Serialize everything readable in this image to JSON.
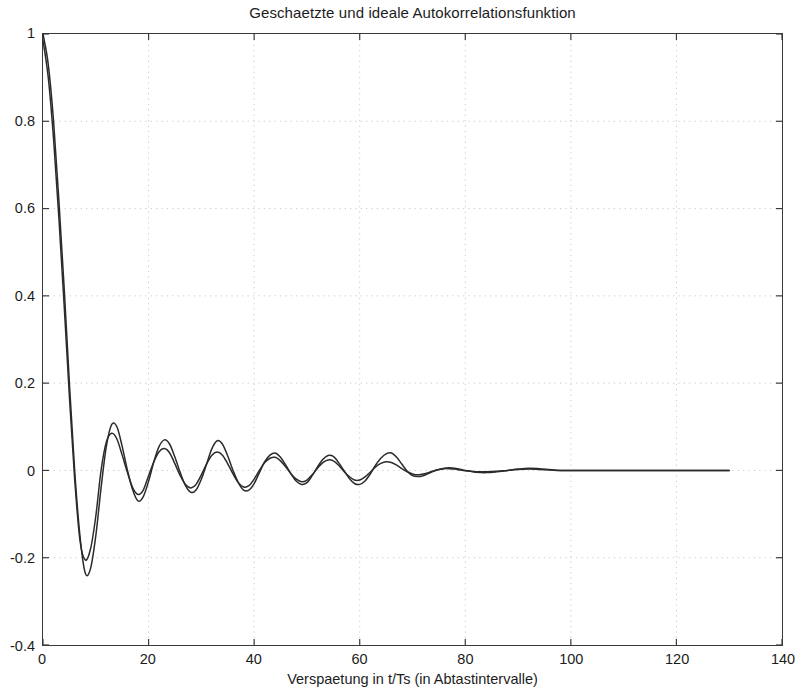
{
  "chart_data": {
    "type": "line",
    "title": "Geschaetzte und ideale Autokorrelationsfunktion",
    "xlabel": "Verspaetung in t/Ts (in Abtastintervalle)",
    "ylabel": "",
    "xlim": [
      0,
      140
    ],
    "ylim": [
      -0.4,
      1.0
    ],
    "xticks": [
      0,
      20,
      40,
      60,
      80,
      100,
      120,
      140
    ],
    "xtick_labels": [
      "0",
      "20",
      "40",
      "60",
      "80",
      "100",
      "120",
      "140"
    ],
    "yticks": [
      -0.4,
      -0.2,
      0,
      0.2,
      0.4,
      0.6,
      0.8,
      1
    ],
    "ytick_labels": [
      "-0.4",
      "-0.2",
      "0",
      "0.2",
      "0.4",
      "0.6",
      "0.8",
      "1"
    ],
    "grid": true,
    "grid_style": "dotted",
    "grid_color": "#c9c9c9",
    "legend": null,
    "line_color": "#2b2b2b",
    "series": [
      {
        "name": "geschaetzte Autokorrelationsfunktion",
        "x": [
          0,
          1,
          2,
          3,
          4,
          5,
          6,
          7,
          8,
          9,
          10,
          11,
          12,
          13,
          14,
          15,
          16,
          17,
          18,
          19,
          20,
          21,
          22,
          23,
          24,
          25,
          26,
          27,
          28,
          29,
          30,
          31,
          32,
          33,
          34,
          35,
          36,
          37,
          38,
          39,
          40,
          41,
          42,
          43,
          44,
          45,
          46,
          47,
          48,
          49,
          50,
          51,
          52,
          53,
          54,
          55,
          56,
          57,
          58,
          59,
          60,
          61,
          62,
          63,
          64,
          65,
          66,
          67,
          68,
          69,
          70,
          71,
          72,
          73,
          74,
          75,
          76,
          77,
          78,
          79,
          80,
          82,
          84,
          86,
          88,
          90,
          92,
          94,
          96,
          98,
          100,
          104,
          108,
          112,
          116,
          120,
          124,
          128,
          130
        ],
        "y": [
          1.0,
          0.93,
          0.8,
          0.62,
          0.42,
          0.2,
          0.0,
          -0.15,
          -0.235,
          -0.225,
          -0.15,
          -0.04,
          0.055,
          0.105,
          0.1,
          0.055,
          0.0,
          -0.045,
          -0.07,
          -0.06,
          -0.025,
          0.02,
          0.055,
          0.07,
          0.06,
          0.03,
          -0.005,
          -0.035,
          -0.05,
          -0.045,
          -0.02,
          0.015,
          0.05,
          0.068,
          0.06,
          0.033,
          0.0,
          -0.028,
          -0.045,
          -0.045,
          -0.03,
          -0.005,
          0.02,
          0.035,
          0.04,
          0.03,
          0.012,
          -0.008,
          -0.025,
          -0.032,
          -0.028,
          -0.012,
          0.008,
          0.025,
          0.034,
          0.032,
          0.018,
          0.0,
          -0.018,
          -0.03,
          -0.032,
          -0.024,
          -0.008,
          0.012,
          0.028,
          0.038,
          0.04,
          0.03,
          0.014,
          -0.002,
          -0.012,
          -0.014,
          -0.012,
          -0.007,
          -0.002,
          0.002,
          0.005,
          0.006,
          0.005,
          0.003,
          0.0,
          -0.004,
          -0.005,
          -0.003,
          0.0,
          0.003,
          0.005,
          0.004,
          0.002,
          0.0,
          0.0,
          0.0,
          0.0,
          0.0,
          0.0,
          0.0,
          0.0,
          0.0,
          0.0
        ]
      },
      {
        "name": "ideale Autokorrelationsfunktion",
        "x": [
          0,
          1,
          2,
          3,
          4,
          5,
          6,
          7,
          8,
          9,
          10,
          11,
          12,
          13,
          14,
          15,
          16,
          17,
          18,
          19,
          20,
          21,
          22,
          23,
          24,
          25,
          26,
          27,
          28,
          29,
          30,
          31,
          32,
          33,
          34,
          35,
          36,
          37,
          38,
          39,
          40,
          41,
          42,
          43,
          44,
          45,
          46,
          47,
          48,
          49,
          50,
          51,
          52,
          53,
          54,
          55,
          56,
          57,
          58,
          59,
          60,
          61,
          62,
          63,
          64,
          65,
          66,
          67,
          68,
          69,
          70,
          71,
          72,
          73,
          74,
          75,
          76,
          77,
          78,
          79,
          80,
          82,
          84,
          86,
          88,
          90,
          92,
          94,
          96,
          98,
          100,
          104,
          108,
          112,
          116,
          120,
          124,
          128,
          130
        ],
        "y": [
          0.985,
          0.9,
          0.76,
          0.58,
          0.38,
          0.17,
          -0.02,
          -0.16,
          -0.205,
          -0.18,
          -0.105,
          0.0,
          0.065,
          0.085,
          0.072,
          0.035,
          -0.005,
          -0.04,
          -0.055,
          -0.045,
          -0.012,
          0.02,
          0.043,
          0.05,
          0.04,
          0.015,
          -0.012,
          -0.032,
          -0.04,
          -0.032,
          -0.01,
          0.015,
          0.035,
          0.042,
          0.035,
          0.015,
          -0.008,
          -0.028,
          -0.038,
          -0.035,
          -0.02,
          0.0,
          0.018,
          0.028,
          0.03,
          0.022,
          0.008,
          -0.008,
          -0.02,
          -0.026,
          -0.022,
          -0.01,
          0.005,
          0.018,
          0.024,
          0.022,
          0.012,
          -0.002,
          -0.014,
          -0.022,
          -0.022,
          -0.015,
          -0.004,
          0.008,
          0.016,
          0.02,
          0.018,
          0.012,
          0.004,
          -0.003,
          -0.008,
          -0.01,
          -0.008,
          -0.005,
          -0.001,
          0.002,
          0.004,
          0.004,
          0.003,
          0.001,
          -0.001,
          -0.003,
          -0.003,
          -0.002,
          0.0,
          0.002,
          0.003,
          0.002,
          0.001,
          0.0,
          0.0,
          0.0,
          0.0,
          0.0,
          0.0,
          0.0,
          0.0,
          0.0,
          0.0
        ]
      }
    ]
  }
}
